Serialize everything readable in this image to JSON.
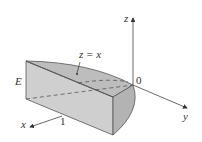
{
  "figure": {
    "type": "3D solid region diagram",
    "labels": {
      "region": "E",
      "surface": "z = x",
      "origin": "0",
      "x_axis": "x",
      "y_axis": "y",
      "z_axis": "z",
      "x_tick": "1"
    },
    "colors": {
      "face_front": "#cfcfcf",
      "face_top": "#bdbdbd",
      "face_side": "#b3b3b3",
      "edge": "#555555",
      "axis": "#444444"
    }
  }
}
